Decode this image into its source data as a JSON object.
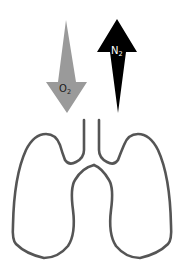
{
  "diagram": {
    "o2_arrow": {
      "label": "O",
      "subscript": "2",
      "direction": "down",
      "color": "#9a9a9a",
      "text_color": "#1a1a1a"
    },
    "n2_arrow": {
      "label": "N",
      "subscript": "2",
      "direction": "up",
      "color": "#000000",
      "text_color": "#ffffff"
    },
    "lungs": {
      "stroke_color": "#555555"
    }
  }
}
